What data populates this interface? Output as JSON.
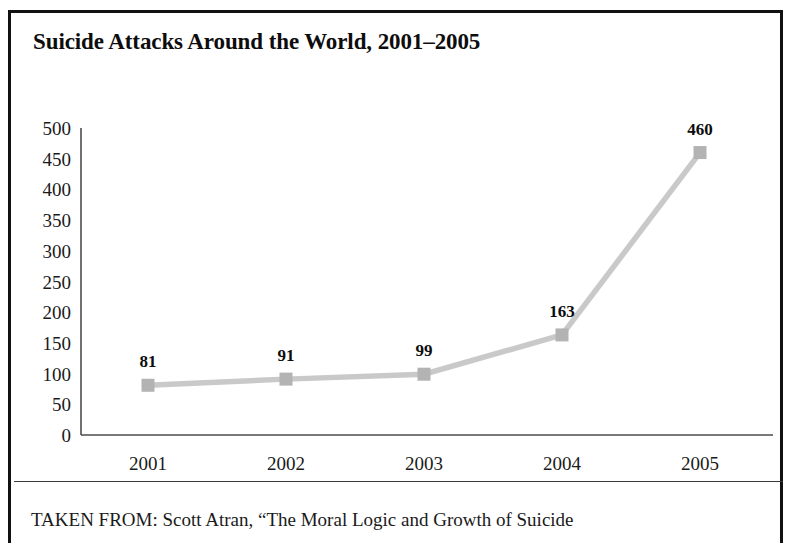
{
  "figure": {
    "title": "Suicide Attacks Around the World, 2001–2005",
    "source_note": "TAKEN FROM: Scott Atran, “The Moral Logic and Growth of Suicide",
    "border_color": "#111111",
    "background_color": "#ffffff"
  },
  "chart_data": {
    "type": "line",
    "title": "Suicide Attacks Around the World, 2001–2005",
    "xlabel": "",
    "ylabel": "",
    "categories": [
      "2001",
      "2002",
      "2003",
      "2004",
      "2005"
    ],
    "values": [
      81,
      91,
      99,
      163,
      460
    ],
    "point_labels": [
      "81",
      "91",
      "99",
      "163",
      "460"
    ],
    "ylim": [
      0,
      500
    ],
    "yticks": [
      0,
      50,
      100,
      150,
      200,
      250,
      300,
      350,
      400,
      450,
      500
    ],
    "ytick_labels": [
      "0",
      "50",
      "100",
      "150",
      "200",
      "250",
      "300",
      "350",
      "400",
      "450",
      "500"
    ],
    "grid": false,
    "legend": false,
    "series": [
      {
        "name": "Suicide attacks",
        "values": [
          81,
          91,
          99,
          163,
          460
        ],
        "line_color": "#c9c9c9",
        "marker_color": "#b3b3b3",
        "marker": "square"
      }
    ],
    "axis_color": "#4d4d4d"
  }
}
